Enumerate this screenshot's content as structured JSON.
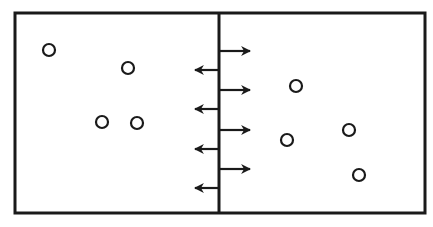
{
  "diagram": {
    "colors": {
      "stroke": "#1a1a1a",
      "background": "#ffffff"
    },
    "box": {
      "x": 15,
      "y": 13,
      "width": 410,
      "height": 200
    },
    "divider_x": 219,
    "left_compartment": {
      "particles": [
        {
          "cx": 49,
          "cy": 50
        },
        {
          "cx": 128,
          "cy": 68
        },
        {
          "cx": 102,
          "cy": 122
        },
        {
          "cx": 137,
          "cy": 123
        }
      ]
    },
    "right_compartment": {
      "particles": [
        {
          "cx": 296,
          "cy": 86
        },
        {
          "cx": 287,
          "cy": 140
        },
        {
          "cx": 349,
          "cy": 130
        },
        {
          "cx": 359,
          "cy": 175
        }
      ]
    },
    "arrows_right": [
      {
        "y": 51
      },
      {
        "y": 90
      },
      {
        "y": 130
      },
      {
        "y": 169
      }
    ],
    "arrows_left": [
      {
        "y": 70
      },
      {
        "y": 109
      },
      {
        "y": 149
      },
      {
        "y": 188
      }
    ]
  }
}
